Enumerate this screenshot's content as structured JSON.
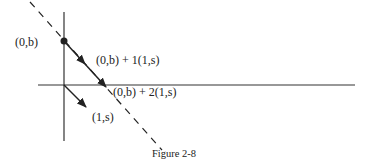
{
  "figure": {
    "caption": "Figure 2-8",
    "labels": {
      "point_0b": "(0,b)",
      "point_step1": "(0,b) + 1(1,s)",
      "point_step2": "(0,b) + 2(1,s)",
      "direction_vector": "(1,s)"
    },
    "elements": {
      "x_axis": "horizontal axis",
      "y_axis": "vertical axis",
      "dashed_line": "line through (0,b) with direction (1,s)",
      "dot": "point (0,b)",
      "arrows": [
        "(0,b) to (0,b)+1(1,s)",
        "(0,b)+1(1,s) to (0,b)+2(1,s)",
        "origin vector (1,s)"
      ]
    },
    "colors": {
      "ink": "#222222",
      "background": "#ffffff"
    }
  }
}
